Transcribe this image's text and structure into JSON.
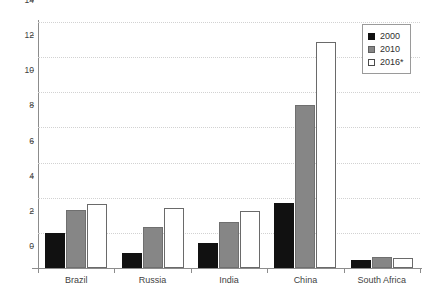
{
  "chart_data": {
    "type": "bar",
    "title": "",
    "subtitle": "",
    "xlabel": "",
    "ylabel": "",
    "ylim": [
      0,
      14
    ],
    "ytick_labels": [
      "0",
      "2",
      "4",
      "6",
      "8",
      "10",
      "12",
      "14"
    ],
    "ytick_values": [
      0,
      2,
      4,
      6,
      8,
      10,
      12,
      14
    ],
    "grid": true,
    "legend_position": "top-right",
    "categories": [
      "Brazil",
      "Russia",
      "India",
      "China",
      "South Africa"
    ],
    "series": [
      {
        "name": "2000",
        "color": "#111111",
        "values": [
          2.0,
          0.85,
          1.45,
          3.7,
          0.45
        ]
      },
      {
        "name": "2010",
        "color": "#868686",
        "values": [
          3.3,
          2.35,
          2.6,
          9.3,
          0.6
        ]
      },
      {
        "name": "2016*",
        "color": "#ffffff",
        "values": [
          3.65,
          3.4,
          3.25,
          12.85,
          0.55
        ]
      }
    ]
  },
  "legend": {
    "items": [
      {
        "label": "2000"
      },
      {
        "label": "2010"
      },
      {
        "label": "2016*"
      }
    ]
  },
  "colors": {
    "axis": "#8c8c8c",
    "grid": "#d2d2d2",
    "text": "#3f3f3f",
    "series_2000": "#111111",
    "series_2010": "#868686",
    "series_2016": "#ffffff"
  }
}
